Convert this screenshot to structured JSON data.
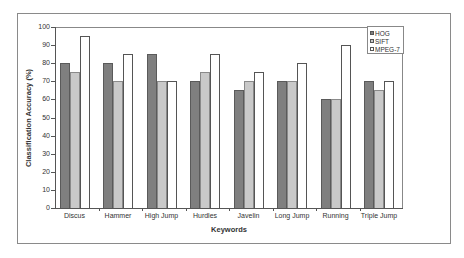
{
  "chart_data": {
    "type": "bar",
    "title": "",
    "xlabel": "Keywords",
    "ylabel": "Classification Accuracy (%)",
    "ylim": [
      0,
      100
    ],
    "yticks": [
      0,
      10,
      20,
      30,
      40,
      50,
      60,
      70,
      80,
      90,
      100
    ],
    "grid": false,
    "legend_position": "top-right",
    "categories": [
      "Discus",
      "Hammer",
      "High Jump",
      "Hurdles",
      "Javelin",
      "Long Jump",
      "Running",
      "Triple Jump"
    ],
    "series": [
      {
        "name": "HOG",
        "color": "#7f7f7f",
        "values": [
          80,
          80,
          85,
          70,
          65,
          70,
          60,
          70
        ]
      },
      {
        "name": "SIFT",
        "color": "#c9c9c9",
        "values": [
          75,
          70,
          70,
          75,
          70,
          70,
          60,
          65
        ]
      },
      {
        "name": "MPEG-7",
        "color": "#ffffff",
        "values": [
          95,
          85,
          70,
          85,
          75,
          80,
          90,
          70
        ]
      }
    ]
  },
  "axes": {
    "xlabel": "Keywords",
    "ylabel": "Classification Accuracy (%)"
  },
  "legend": {
    "items": [
      {
        "label": "HOG",
        "color": "#7f7f7f"
      },
      {
        "label": "SIFT",
        "color": "#c9c9c9"
      },
      {
        "label": "MPEG-7",
        "color": "#ffffff"
      }
    ]
  }
}
